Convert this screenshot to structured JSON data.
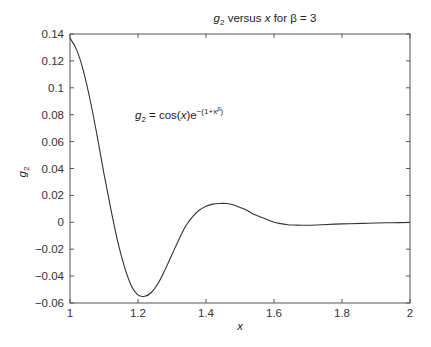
{
  "chart_data": {
    "type": "line",
    "title": "g2 versus x for β = 3",
    "title_parts": {
      "var": "g",
      "sub": "2",
      "mid": " versus ",
      "x": "x",
      "rest": " for β = 3"
    },
    "xlabel": "x",
    "ylabel": "g2",
    "ylabel_parts": {
      "var": "g",
      "sub": "2"
    },
    "annotation": "g2 = cos(x)e^-(1+x^β)",
    "annotation_parts": {
      "var": "g",
      "sub": "2",
      "eq": " = cos(",
      "x": "x",
      "close": ")e",
      "sup": "−(1+x",
      "supsup": "β",
      "end": ")"
    },
    "xlim": [
      1,
      2
    ],
    "ylim": [
      -0.06,
      0.14
    ],
    "xticks": [
      "1",
      "1.2",
      "1.4",
      "1.6",
      "1.8",
      "2"
    ],
    "xtick_values": [
      1,
      1.2,
      1.4,
      1.6,
      1.8,
      2
    ],
    "yticks": [
      "0.14",
      "0.12",
      "0.1",
      "0.08",
      "0.06",
      "0.04",
      "0.02",
      "0",
      "−0.02",
      "−0.04",
      "−0.06"
    ],
    "ytick_values": [
      0.14,
      0.12,
      0.1,
      0.08,
      0.06,
      0.04,
      0.02,
      0,
      -0.02,
      -0.04,
      -0.06
    ],
    "grid": false,
    "series": [
      {
        "name": "g2",
        "x": [
          1.0,
          1.02,
          1.04,
          1.06,
          1.08,
          1.1,
          1.12,
          1.14,
          1.16,
          1.18,
          1.2,
          1.22,
          1.24,
          1.26,
          1.28,
          1.3,
          1.32,
          1.34,
          1.36,
          1.38,
          1.4,
          1.42,
          1.44,
          1.46,
          1.48,
          1.5,
          1.52,
          1.54,
          1.56,
          1.58,
          1.6,
          1.62,
          1.64,
          1.66,
          1.68,
          1.7,
          1.74,
          1.8,
          1.86,
          1.9,
          1.95,
          2.0
        ],
        "y": [
          0.137,
          0.128,
          0.112,
          0.09,
          0.064,
          0.036,
          0.01,
          -0.014,
          -0.033,
          -0.047,
          -0.054,
          -0.055,
          -0.052,
          -0.045,
          -0.035,
          -0.024,
          -0.013,
          -0.003,
          0.004,
          0.009,
          0.012,
          0.0135,
          0.014,
          0.014,
          0.013,
          0.011,
          0.009,
          0.006,
          0.004,
          0.002,
          0.0,
          -0.001,
          -0.0018,
          -0.002,
          -0.0022,
          -0.0022,
          -0.0018,
          -0.0012,
          -0.0008,
          -0.0005,
          -0.0003,
          -0.0002
        ]
      }
    ]
  }
}
